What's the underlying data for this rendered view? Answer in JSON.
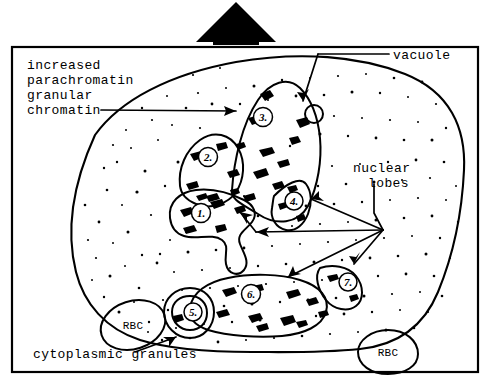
{
  "figure": {
    "ink_color": "#000000",
    "background_color": "#ffffff"
  },
  "pointer": {
    "name": "up-arrow-marker",
    "description": "large solid black arrow pointing up, above the framed panel"
  },
  "labels": {
    "chromatin": {
      "lines": [
        "increased",
        "parachromatin",
        "granular",
        "chromatin"
      ],
      "text": "increased parachromatin granular chromatin"
    },
    "vacuole": "vacuole",
    "nuclear_lobes": {
      "lines": [
        "nuclear",
        "lobes"
      ],
      "text": "nuclear lobes"
    },
    "cytoplasmic_granules": "cytoplasmic granules",
    "rbc_left": "RBC",
    "rbc_right": "RBC"
  },
  "nuclear_lobes": [
    {
      "id": 1,
      "label": "1."
    },
    {
      "id": 2,
      "label": "2."
    },
    {
      "id": 3,
      "label": "3."
    },
    {
      "id": 4,
      "label": "4."
    },
    {
      "id": 5,
      "label": "5."
    },
    {
      "id": 6,
      "label": "6."
    },
    {
      "id": 7,
      "label": "7."
    }
  ],
  "structures": {
    "cell": "neutrophil cytoplasm with stippled granules",
    "vacuole": "small open circle at edge of lobe 3",
    "red_blood_cells": 2
  }
}
